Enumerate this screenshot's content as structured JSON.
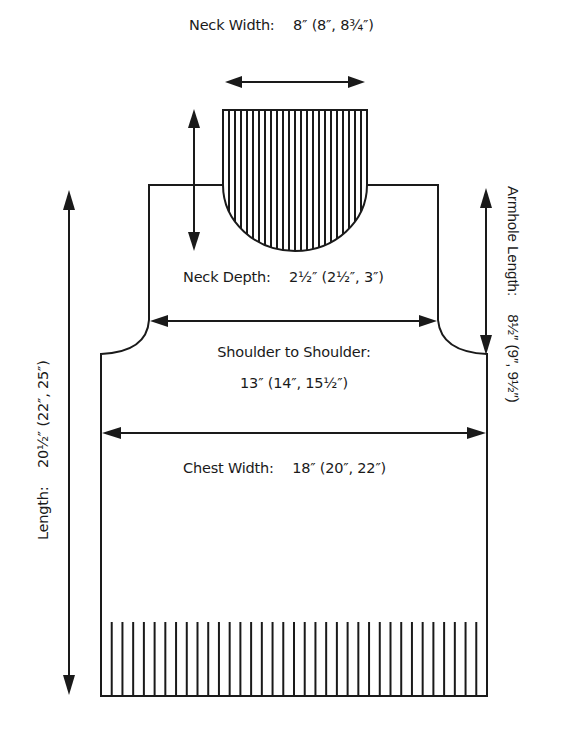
{
  "diagram": {
    "type": "knitting-schematic",
    "garment": "vest-front",
    "colors": {
      "line": "#1a1a1a",
      "background": "#ffffff"
    },
    "measurements": {
      "neck_width": {
        "label": "Neck Width:",
        "value": "8″ (8″, 8¾″)"
      },
      "neck_depth": {
        "label": "Neck Depth:",
        "value": "2½″ (2½″, 3″)"
      },
      "shoulder_to_shoulder": {
        "label": "Shoulder to Shoulder:",
        "value": "13″ (14″, 15½″)"
      },
      "chest_width": {
        "label": "Chest Width:",
        "value": "18″ (20″, 22″)"
      },
      "length": {
        "label": "Length:",
        "value": "20½″ (22″, 25″)"
      },
      "armhole_length": {
        "label": "Armhole Length:",
        "value": "8½″ (9″, 9½″)"
      }
    },
    "ribbing": {
      "neck_band_lines": 23,
      "hem_band_lines": 35
    }
  }
}
